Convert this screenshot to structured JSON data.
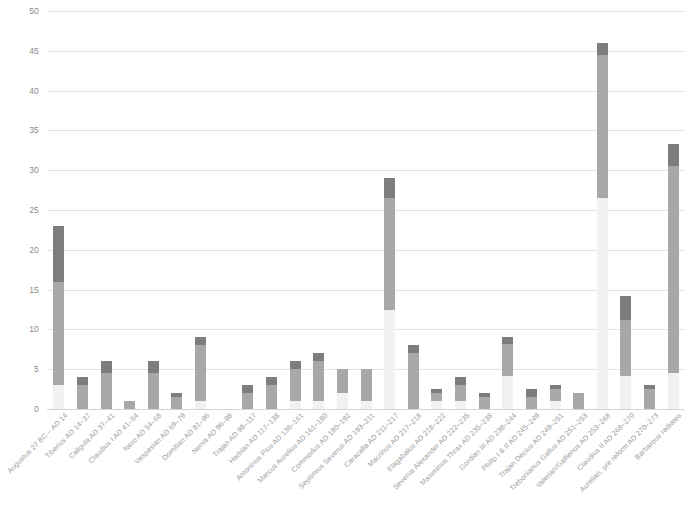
{
  "chart_data": {
    "type": "bar",
    "subtype": "stacked-column",
    "title": "",
    "xlabel": "",
    "ylabel": "",
    "ylim": [
      0,
      50
    ],
    "yticks": [
      0,
      5,
      10,
      15,
      20,
      25,
      30,
      35,
      40,
      45,
      50
    ],
    "grid": true,
    "legend": "none",
    "colors": {
      "series1": "#f1f1f1",
      "series2": "#a8a8a8",
      "series3": "#7d7d7d",
      "gridline": "#e2e2e2",
      "tick_text": "#8a8a8a",
      "label_text": "#9b9b9b"
    },
    "categories": [
      "Augustus 27 BC – AD 14",
      "Tiberius AD 14–37",
      "Caligula AD 37–41",
      "Claudius I AD 41–54",
      "Nero AD 54–68",
      "Vespasian AD 69–79",
      "Domitian AD 81–96",
      "Nerva AD 96–98",
      "Trajan AD 98–117",
      "Hadrian AD 117–138",
      "Antoninus Pius AD 138–161",
      "Marcus Aurelius AD 161–180",
      "Commodus AD 180–192",
      "Septimius Severus AD 193–211",
      "Caracalla AD 211–217",
      "Macrinus AD 217–218",
      "Elagabalus AD 218–222",
      "Severus Alexander AD 222–235",
      "Maximinus Thrax AD 235–238",
      "Gordian III AD 238–244",
      "Philip I & II AD 245–249",
      "Trajan Decius AD 249–251",
      "Trebonianus Gallus AD 251–253",
      "Valerian/Gallienus AD 253–268",
      "Claudius II AD 268–270",
      "Aurelian, pre reform AD 270–273",
      "Barbarous radiates"
    ],
    "series": [
      {
        "name": "series1",
        "values": [
          3.0,
          0.0,
          0.0,
          0.0,
          0.0,
          0.0,
          1.0,
          0.0,
          0.0,
          0.0,
          1.0,
          1.0,
          2.0,
          1.0,
          12.5,
          0.0,
          1.0,
          1.0,
          0.0,
          4.2,
          0.0,
          1.0,
          0.0,
          26.5,
          4.2,
          0.0,
          4.5
        ]
      },
      {
        "name": "series2",
        "values": [
          13.0,
          3.0,
          4.5,
          1.0,
          4.5,
          1.5,
          7.0,
          0.0,
          2.0,
          3.0,
          4.0,
          5.0,
          3.0,
          4.0,
          14.0,
          7.0,
          1.0,
          2.0,
          1.5,
          4.0,
          1.5,
          1.5,
          2.0,
          18.0,
          7.0,
          2.5,
          26.0
        ]
      },
      {
        "name": "series3",
        "values": [
          7.0,
          1.0,
          1.5,
          0.0,
          1.5,
          0.5,
          1.0,
          0.0,
          1.0,
          1.0,
          1.0,
          1.0,
          0.0,
          0.0,
          2.5,
          1.0,
          0.5,
          1.0,
          0.5,
          0.8,
          1.0,
          0.5,
          0.0,
          1.5,
          3.0,
          0.5,
          2.8
        ]
      }
    ],
    "totals": [
      23.0,
      4.0,
      6.0,
      1.0,
      6.0,
      2.0,
      9.0,
      0.0,
      3.0,
      4.0,
      6.0,
      7.0,
      5.0,
      5.0,
      29.0,
      8.0,
      2.5,
      4.0,
      2.0,
      9.0,
      2.5,
      3.0,
      2.0,
      46.0,
      14.2,
      3.0,
      33.3
    ]
  }
}
